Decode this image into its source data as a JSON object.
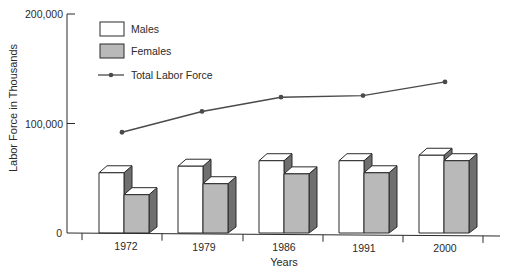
{
  "chart_data": {
    "type": "bar",
    "title": "",
    "xlabel": "Years",
    "ylabel": "Labor Force in Thousands",
    "categories": [
      "1972",
      "1979",
      "1986",
      "1991",
      "2000"
    ],
    "series": [
      {
        "name": "Males",
        "kind": "bar",
        "values": [
          55000,
          61000,
          66000,
          66000,
          71000
        ]
      },
      {
        "name": "Females",
        "kind": "bar",
        "values": [
          35000,
          45000,
          54000,
          55000,
          66000
        ]
      },
      {
        "name": "Total Labor Force",
        "kind": "line",
        "values": [
          92000,
          111000,
          124000,
          125500,
          138000
        ]
      }
    ],
    "ylim": [
      0,
      200000
    ],
    "yticks": [
      0,
      100000,
      200000
    ],
    "ytick_labels": [
      "0",
      "100,000",
      "200,000"
    ],
    "grid": false,
    "legend_position": "upper-left",
    "style": "3d-bars"
  },
  "legend": {
    "males": "Males",
    "females": "Females",
    "total": "Total Labor Force"
  },
  "axes": {
    "x_title": "Years",
    "y_title": "Labor Force in Thousands"
  },
  "colors": {
    "male_front": "#ffffff",
    "female_front": "#b9b9b9",
    "side": "#6f6f6f",
    "top": "#ffffff",
    "stroke": "#2a2a2a",
    "line": "#4a4a4a"
  }
}
